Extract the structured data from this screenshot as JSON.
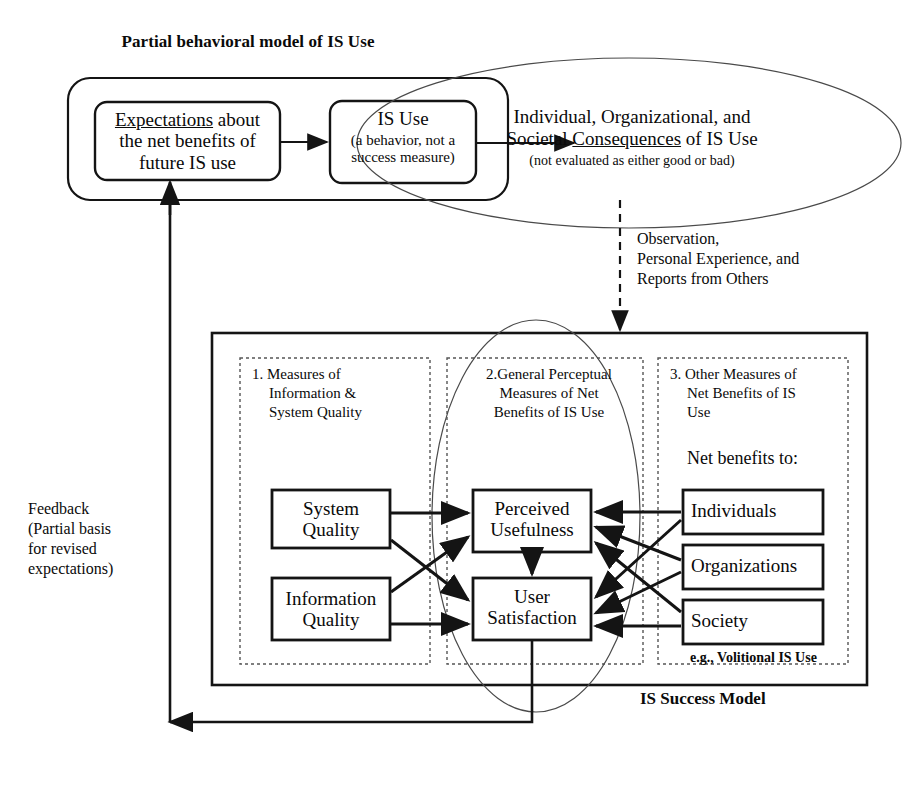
{
  "diagram": {
    "title": "Partial behavioral model of IS Use",
    "footer_label": "IS Success Model",
    "colors": {
      "line": "#141414",
      "text": "#0a0a0a",
      "background": "#ffffff"
    }
  },
  "top_model": {
    "expectations": {
      "line1_underlined": "Expectations",
      "line1_rest": " about",
      "line2": "the net benefits of",
      "line3": "future IS use"
    },
    "is_use": {
      "title": "IS Use",
      "sub1": "(a behavior, not a",
      "sub2": "success measure)"
    },
    "consequences": {
      "line1": "Individual, Organizational, and",
      "line2_pre": "Societal ",
      "line2_underlined": "Consequences",
      "line2_post": " of IS Use",
      "sub": "(not evaluated as either good or bad)"
    }
  },
  "observation": {
    "line1": "Observation,",
    "line2": "Personal Experience, and",
    "line3": "Reports from Others"
  },
  "feedback": {
    "line1": "Feedback",
    "line2": "(Partial basis",
    "line3": "for revised",
    "line4": "expectations)"
  },
  "success_model": {
    "groups": [
      {
        "number": "1.",
        "heading_line1": "Measures of",
        "heading_line2": "Information &",
        "heading_line3": "System Quality"
      },
      {
        "number": "2.",
        "heading_line1": "General Perceptual",
        "heading_line2": "Measures of Net",
        "heading_line3": "Benefits of IS Use"
      },
      {
        "number": "3.",
        "heading_line1": "Other Measures of",
        "heading_line2": "Net Benefits of IS",
        "heading_line3": "Use"
      }
    ],
    "net_benefits_label": "Net benefits to:",
    "note": "e.g., Volitional IS Use",
    "nodes": {
      "system_quality_l1": "System",
      "system_quality_l2": "Quality",
      "information_quality_l1": "Information",
      "information_quality_l2": "Quality",
      "perceived_usefulness_l1": "Perceived",
      "perceived_usefulness_l2": "Usefulness",
      "user_satisfaction_l1": "User",
      "user_satisfaction_l2": "Satisfaction",
      "individuals": "Individuals",
      "organizations": "Organizations",
      "society": "Society"
    }
  }
}
